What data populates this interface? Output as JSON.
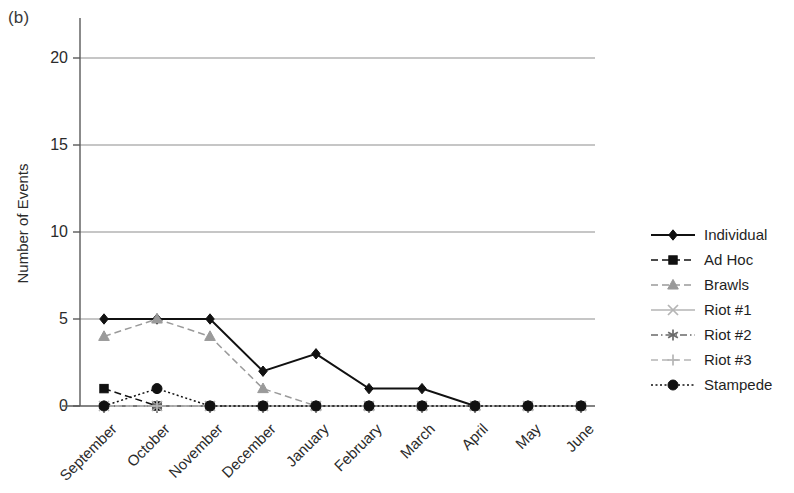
{
  "panel": {
    "label": "(b)"
  },
  "axes": {
    "y_title": "Number of Events",
    "y_ticks": [
      "0",
      "5",
      "10",
      "15",
      "20"
    ],
    "x_ticks": [
      "September",
      "October",
      "November",
      "December",
      "January",
      "February",
      "March",
      "April",
      "May",
      "June"
    ]
  },
  "legend": {
    "items": [
      {
        "label": "Individual",
        "marker": "diamond-marker",
        "dash": "none",
        "color": "#111111"
      },
      {
        "label": "Ad Hoc",
        "marker": "square-marker",
        "dash": "dashed",
        "color": "#111111"
      },
      {
        "label": "Brawls",
        "marker": "triangle-marker",
        "dash": "dashed-light",
        "color": "#111111"
      },
      {
        "label": "Riot #1",
        "marker": "cross-x-marker",
        "dash": "light",
        "color": "#111111"
      },
      {
        "label": "Riot #2",
        "marker": "asterisk-marker",
        "dash": "dash-dot",
        "color": "#111111"
      },
      {
        "label": "Riot #3",
        "marker": "plus-marker",
        "dash": "dash-light",
        "color": "#111111"
      },
      {
        "label": "Stampede",
        "marker": "circle-marker",
        "dash": "dotted",
        "color": "#111111"
      }
    ]
  },
  "chart_data": {
    "type": "line",
    "title": "(b)",
    "xlabel": "",
    "ylabel": "Number of Events",
    "categories": [
      "September",
      "October",
      "November",
      "December",
      "January",
      "February",
      "March",
      "April",
      "May",
      "June"
    ],
    "ylim": [
      0,
      20
    ],
    "yticks": [
      0,
      5,
      10,
      15,
      20
    ],
    "grid": "horizontal",
    "legend_position": "right",
    "series": [
      {
        "name": "Individual",
        "values": [
          5,
          5,
          5,
          2,
          3,
          1,
          1,
          0,
          0,
          0
        ],
        "marker": "diamond",
        "linestyle": "solid",
        "color": "#111111"
      },
      {
        "name": "Ad Hoc",
        "values": [
          1,
          0,
          0,
          0,
          0,
          0,
          0,
          0,
          0,
          0
        ],
        "marker": "square",
        "linestyle": "dashed",
        "color": "#111111"
      },
      {
        "name": "Brawls",
        "values": [
          4,
          5,
          4,
          1,
          0,
          0,
          0,
          0,
          0,
          0
        ],
        "marker": "triangle",
        "linestyle": "dashed",
        "color": "#9a9a9a"
      },
      {
        "name": "Riot #1",
        "values": [
          0,
          0,
          0,
          0,
          0,
          0,
          0,
          0,
          0,
          0
        ],
        "marker": "x",
        "linestyle": "solid",
        "color": "#b5b5b5"
      },
      {
        "name": "Riot #2",
        "values": [
          0,
          0,
          0,
          0,
          0,
          0,
          0,
          0,
          0,
          0
        ],
        "marker": "asterisk",
        "linestyle": "dashdot",
        "color": "#6a6a6a"
      },
      {
        "name": "Riot #3",
        "values": [
          0,
          0,
          0,
          0,
          0,
          0,
          0,
          0,
          0,
          0
        ],
        "marker": "plus",
        "linestyle": "dashed",
        "color": "#b5b5b5"
      },
      {
        "name": "Stampede",
        "values": [
          0,
          1,
          0,
          0,
          0,
          0,
          0,
          0,
          0,
          0
        ],
        "marker": "circle",
        "linestyle": "dotted",
        "color": "#111111"
      }
    ]
  }
}
